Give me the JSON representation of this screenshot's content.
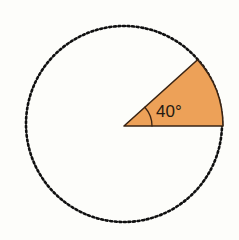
{
  "figure": {
    "kind": "circle-sector-angle-diagram",
    "background_color": "#fdfdfa",
    "width": 239,
    "height": 240
  },
  "circle": {
    "name": "dotted-circle",
    "center_x": 124,
    "center_y": 124,
    "radius": 98,
    "stroke_color": "#101010",
    "stroke_width": 2.6,
    "stroke_style": "dotted",
    "dash_on": 2.0,
    "dash_gap": 2.6,
    "fill": "none"
  },
  "sector": {
    "name": "orange-sector",
    "fill_color": "#eda158",
    "stroke_color": "#3a2414",
    "stroke_width": 1.6,
    "start_angle_deg": 0,
    "end_angle_deg": 42,
    "vertex_x": 124,
    "vertex_y": 126,
    "arc_start_x": 223,
    "arc_start_y": 126,
    "arc_end_x": 197,
    "arc_end_y": 60
  },
  "angle_arc": {
    "name": "angle-indicator-arc",
    "radius": 28,
    "stroke_color": "#3a2414",
    "stroke_width": 1.3
  },
  "label": {
    "name": "angle-label",
    "text": "40°",
    "value": 40,
    "unit": "degrees",
    "x": 156,
    "y": 117,
    "font_size": 17,
    "color": "#241a12"
  }
}
